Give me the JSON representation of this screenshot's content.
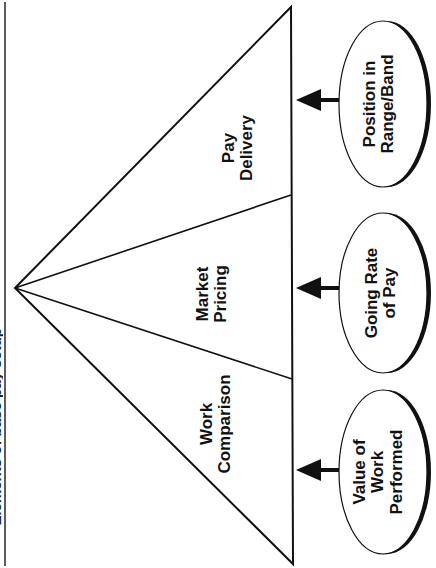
{
  "title": {
    "text": "Elements of base pay setup"
  },
  "triangle": {
    "segments": [
      {
        "id": "pay-delivery",
        "line1": "Pay",
        "line2": "Delivery"
      },
      {
        "id": "market-pricing",
        "line1": "Market",
        "line2": "Pricing"
      },
      {
        "id": "work-comparison",
        "line1": "Work",
        "line2": "Comparison"
      }
    ]
  },
  "ovals": [
    {
      "id": "position-in-range",
      "line1": "Position in",
      "line2": "Range/Band",
      "line3": ""
    },
    {
      "id": "going-rate",
      "line1": "Going Rate",
      "line2": "of Pay",
      "line3": ""
    },
    {
      "id": "value-of-work",
      "line1": "Value of",
      "line2": "Work",
      "line3": "Performed"
    }
  ],
  "colors": {
    "stroke": "#111111",
    "fill": "#ffffff",
    "background": "#ffffff"
  }
}
